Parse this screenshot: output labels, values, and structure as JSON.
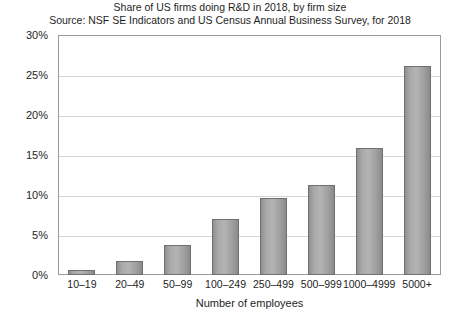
{
  "chart_data": {
    "type": "bar",
    "title": "Share of US firms doing R&D in 2018, by firm size",
    "subtitle": "Source: NSF SE Indicators and US Census Annual Business Survey, for 2018",
    "xlabel": "Number of employees",
    "ylabel": "",
    "categories": [
      "10–19",
      "20–49",
      "50–99",
      "100–249",
      "250–499",
      "500–999",
      "1000–4999",
      "5000+"
    ],
    "values": [
      0.6,
      1.8,
      3.8,
      7.0,
      9.6,
      11.3,
      15.9,
      26.1
    ],
    "ylim": [
      0,
      30
    ],
    "ytick_values": [
      0,
      5,
      10,
      15,
      20,
      25,
      30
    ],
    "ytick_labels": [
      "0%",
      "5%",
      "10%",
      "15%",
      "20%",
      "25%",
      "30%"
    ],
    "grid": true,
    "legend": false,
    "bar_color": "#a8a8a8",
    "bar_border_color": "#6f6f6f",
    "gridline_color": "#d5d5d5",
    "axis_color": "#9b9b9b",
    "background_color": "#ffffff",
    "text_color": "#1e1e1e"
  }
}
